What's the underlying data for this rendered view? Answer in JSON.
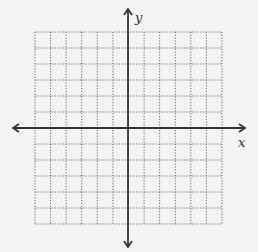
{
  "diagram": {
    "type": "coordinate-plane",
    "axes": {
      "x_label": "x",
      "y_label": "y"
    },
    "grid": {
      "columns": 12,
      "rows": 12,
      "style": "dotted",
      "left": 35,
      "right": 222,
      "top": 32,
      "bottom": 224,
      "origin_x": 128,
      "origin_y": 128
    },
    "colors": {
      "background": "#f4f4f4",
      "axis": "#333333",
      "grid": "#666666"
    }
  }
}
